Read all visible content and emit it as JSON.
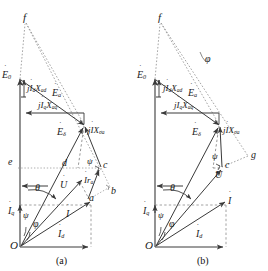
{
  "figure": {
    "type": "phasor-diagram",
    "stroke_color": "#3a3a3a",
    "dashed_color": "#8a8a8a",
    "text_color": "#1a1a1a"
  },
  "panels": [
    {
      "id": "a",
      "caption": "(a)",
      "points": [
        {
          "name": "f",
          "label": "f",
          "x": 25,
          "y": 19
        },
        {
          "name": "e",
          "label": "e",
          "x": 11,
          "y": 163
        },
        {
          "name": "d",
          "label": "d",
          "x": 64,
          "y": 165
        },
        {
          "name": "c",
          "label": "c",
          "x": 103,
          "y": 166
        },
        {
          "name": "b",
          "label": "b",
          "x": 110,
          "y": 193
        },
        {
          "name": "a",
          "label": "a",
          "x": 92,
          "y": 205
        },
        {
          "name": "O",
          "label": "O",
          "x": 13,
          "y": 247
        }
      ],
      "phasors": [
        {
          "name": "E0",
          "label": "E",
          "sub": "0",
          "dot": true
        },
        {
          "name": "Ea",
          "label": "E",
          "sub": "a",
          "dot": true
        },
        {
          "name": "Edelta",
          "label": "E",
          "sub": "δ",
          "dot": true
        },
        {
          "name": "U",
          "label": "U",
          "sub": "",
          "dot": true
        },
        {
          "name": "I",
          "label": "I",
          "sub": "",
          "dot": true
        },
        {
          "name": "Id",
          "label": "I",
          "sub": "d",
          "dot": true
        },
        {
          "name": "Iq",
          "label": "I",
          "sub": "q",
          "dot": true
        }
      ],
      "drop_labels": [
        {
          "name": "jIdXad",
          "text": "j",
          "var1": "I",
          "sub1": "d",
          "var2": "X",
          "sub2": "ad",
          "x": 27,
          "y": 89
        },
        {
          "name": "jIqXaq",
          "text": "j",
          "var1": "I",
          "sub1": "q",
          "var2": "X",
          "sub2": "aq",
          "x": 38,
          "y": 107
        },
        {
          "name": "jIXsigma",
          "text": "j",
          "var1": "I",
          "sub1": "",
          "var2": "X",
          "sub2": "σa",
          "x": 88,
          "y": 127
        },
        {
          "name": "Ira",
          "text": "",
          "var1": "I",
          "sub1": "",
          "var2": "r",
          "sub2": "a",
          "x": 84,
          "y": 180
        }
      ],
      "angles": [
        {
          "name": "theta",
          "label": "θ",
          "x": 37,
          "y": 190
        },
        {
          "name": "psi-upper",
          "label": "ψ",
          "x": 88,
          "y": 161
        },
        {
          "name": "psi-lower",
          "label": "ψ",
          "x": 24,
          "y": 215
        },
        {
          "name": "phi",
          "label": "φ",
          "x": 36,
          "y": 222
        }
      ]
    },
    {
      "id": "b",
      "caption": "(b)",
      "points": [
        {
          "name": "f",
          "label": "f",
          "x": 160,
          "y": 19
        },
        {
          "name": "g",
          "label": "g",
          "x": 250,
          "y": 155
        },
        {
          "name": "c",
          "label": "c",
          "x": 225,
          "y": 165
        },
        {
          "name": "O",
          "label": "O",
          "x": 148,
          "y": 247
        }
      ],
      "phasors": [
        {
          "name": "E0",
          "label": "E",
          "sub": "0",
          "dot": true
        },
        {
          "name": "Ea",
          "label": "E",
          "sub": "a",
          "dot": true
        },
        {
          "name": "Edelta",
          "label": "E",
          "sub": "δ",
          "dot": true
        },
        {
          "name": "U",
          "label": "U",
          "sub": "",
          "dot": true
        },
        {
          "name": "I",
          "label": "I",
          "sub": "",
          "dot": true
        },
        {
          "name": "Id",
          "label": "I",
          "sub": "d",
          "dot": true
        },
        {
          "name": "Iq",
          "label": "I",
          "sub": "q",
          "dot": true
        }
      ],
      "drop_labels": [
        {
          "name": "jIdXad",
          "text": "j",
          "var1": "I",
          "sub1": "d",
          "var2": "X",
          "sub2": "ad",
          "x": 163,
          "y": 89
        },
        {
          "name": "jIqXaq",
          "text": "j",
          "var1": "I",
          "sub1": "q",
          "var2": "X",
          "sub2": "aq",
          "x": 174,
          "y": 107
        },
        {
          "name": "jIXsigma",
          "text": "j",
          "var1": "I",
          "sub1": "",
          "var2": "X",
          "sub2": "σa",
          "x": 223,
          "y": 127
        }
      ],
      "angles": [
        {
          "name": "phi-top",
          "label": "φ",
          "x": 207,
          "y": 57
        },
        {
          "name": "theta",
          "label": "θ",
          "x": 172,
          "y": 190
        },
        {
          "name": "psi-upper",
          "label": "ψ",
          "x": 213,
          "y": 157
        },
        {
          "name": "psi-lower",
          "label": "ψ",
          "x": 159,
          "y": 215
        },
        {
          "name": "phi",
          "label": "φ",
          "x": 172,
          "y": 222
        }
      ]
    }
  ]
}
